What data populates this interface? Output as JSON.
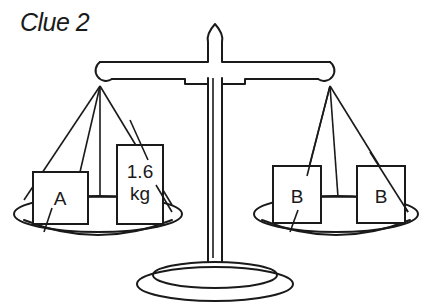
{
  "title": "Clue 2",
  "scale": {
    "left_pan": {
      "items": [
        {
          "label": "A"
        },
        {
          "label_line1": "1.6",
          "label_line2": "kg"
        }
      ]
    },
    "right_pan": {
      "items": [
        {
          "label": "B"
        },
        {
          "label": "B"
        }
      ]
    }
  },
  "colors": {
    "ink": "#1a1a1a",
    "background": "#ffffff"
  }
}
